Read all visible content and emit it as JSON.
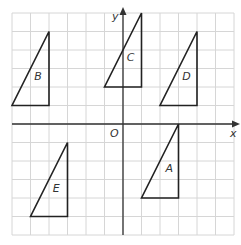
{
  "diagram": {
    "type": "coordinate-grid-with-triangles",
    "grid": {
      "x_min": -6,
      "x_max": 6,
      "y_min": -6,
      "y_max": 6,
      "origin_px": [
        123,
        124
      ],
      "unit_px": 18.5,
      "line_color": "#d6d6d6"
    },
    "axes": {
      "x_label": "x",
      "y_label": "y",
      "origin_label": "O",
      "color": "#333333"
    },
    "triangles": [
      {
        "label": "A",
        "vertices": [
          [
            1,
            -4
          ],
          [
            3,
            -4
          ],
          [
            3,
            0
          ]
        ],
        "label_pos": [
          2.3,
          -2.6
        ]
      },
      {
        "label": "B",
        "vertices": [
          [
            -6,
            1
          ],
          [
            -4,
            1
          ],
          [
            -4,
            5
          ]
        ],
        "label_pos": [
          -4.8,
          2.4
        ]
      },
      {
        "label": "C",
        "vertices": [
          [
            -1,
            2
          ],
          [
            1,
            2
          ],
          [
            1,
            6
          ]
        ],
        "label_pos": [
          0.2,
          3.4
        ]
      },
      {
        "label": "D",
        "vertices": [
          [
            2,
            1
          ],
          [
            4,
            1
          ],
          [
            4,
            5
          ]
        ],
        "label_pos": [
          3.2,
          2.4
        ]
      },
      {
        "label": "E",
        "vertices": [
          [
            -5,
            -5
          ],
          [
            -3,
            -5
          ],
          [
            -3,
            -1
          ]
        ],
        "label_pos": [
          -3.8,
          -3.7
        ]
      }
    ],
    "stroke_color": "#222222"
  }
}
